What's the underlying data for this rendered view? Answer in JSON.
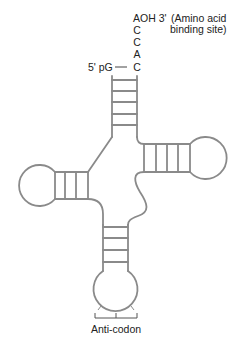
{
  "diagram": {
    "colors": {
      "line": "#8a8a8a",
      "text": "#222222",
      "background": "#ffffff"
    },
    "labels": {
      "three_prime_end": "AOH 3'",
      "amino_acid_site_line1": "(Amino acid",
      "amino_acid_site_line2": "binding site)",
      "cca_tail": [
        "C",
        "C",
        "A",
        "C"
      ],
      "five_prime_end": "5' pG",
      "anticodon": "Anti-codon"
    },
    "arms": [
      {
        "name": "acceptor-stem",
        "base_pairs": 5
      },
      {
        "name": "d-arm",
        "base_pairs": 3
      },
      {
        "name": "t-arm",
        "base_pairs": 4
      },
      {
        "name": "anticodon-arm",
        "base_pairs": 4
      }
    ]
  }
}
